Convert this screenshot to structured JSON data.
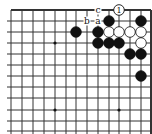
{
  "diagram": {
    "type": "go-board-corner",
    "corner": "top-right",
    "grid": {
      "x_lines": [
        11,
        22,
        33,
        44,
        55,
        66,
        76,
        87,
        98,
        109,
        119,
        130,
        141,
        151
      ],
      "y_lines": [
        10,
        21,
        32,
        43,
        54,
        65,
        76,
        87,
        98,
        110,
        121,
        131
      ],
      "top_edge_y": 10,
      "right_edge_x": 151,
      "line_color": "#333333",
      "edge_width": 2
    },
    "star_points": [
      {
        "x": 55,
        "y": 43
      },
      {
        "x": 55,
        "y": 110
      },
      {
        "x": 119,
        "y": 110
      }
    ],
    "stones": [
      {
        "color": "black",
        "x": 109,
        "y": 21
      },
      {
        "color": "black",
        "x": 141,
        "y": 21
      },
      {
        "color": "black",
        "x": 76,
        "y": 32
      },
      {
        "color": "black",
        "x": 98,
        "y": 32
      },
      {
        "color": "white",
        "x": 109,
        "y": 32
      },
      {
        "color": "white",
        "x": 119,
        "y": 32
      },
      {
        "color": "white",
        "x": 130,
        "y": 32
      },
      {
        "color": "white",
        "x": 141,
        "y": 32
      },
      {
        "color": "black",
        "x": 98,
        "y": 43
      },
      {
        "color": "black",
        "x": 109,
        "y": 43
      },
      {
        "color": "black",
        "x": 119,
        "y": 43
      },
      {
        "color": "white",
        "x": 141,
        "y": 43
      },
      {
        "color": "black",
        "x": 130,
        "y": 54
      },
      {
        "color": "black",
        "x": 141,
        "y": 54
      },
      {
        "color": "black",
        "x": 141,
        "y": 76
      }
    ],
    "numbered_stones": [
      {
        "color": "white",
        "x": 119,
        "y": 10,
        "label": "1"
      }
    ],
    "letter_marks": [
      {
        "label": "c",
        "x": 98,
        "y": 10
      },
      {
        "label": "b",
        "x": 87,
        "y": 21
      },
      {
        "label": "a",
        "x": 98,
        "y": 21
      }
    ]
  }
}
